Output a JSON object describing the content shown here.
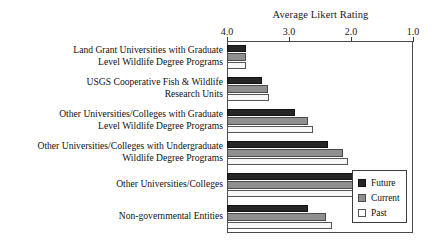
{
  "chart_data": {
    "type": "bar",
    "orientation": "horizontal",
    "title": "Average Likert Rating",
    "xlabel": "",
    "ylabel": "",
    "xlim": [
      4.0,
      1.0
    ],
    "xticks": [
      "4.0",
      "3.0",
      "2.0",
      "1.0"
    ],
    "xtick_values": [
      4.0,
      3.0,
      2.0,
      1.0
    ],
    "axis_reversed": true,
    "grid": false,
    "legend_position": "lower-right",
    "categories": [
      "Land Grant Universities with Graduate\nLevel Wildlife Degree Programs",
      "USGS Cooperative Fish & Wildlife\nResearch Units",
      "Other Universities/Colleges with Graduate\nLevel Wildlife Degree Programs",
      "Other Universities/Colleges with Undergraduate\nWildlife Degree Programs",
      "Other Universities/Colleges",
      "Non-governmental Entities"
    ],
    "series": [
      {
        "name": "Future",
        "color": "#262626",
        "values": [
          1.31,
          1.57,
          2.1,
          2.63,
          3.29,
          2.31
        ]
      },
      {
        "name": "Current",
        "color": "#8f8f8f",
        "values": [
          1.31,
          1.66,
          2.31,
          2.87,
          3.19,
          2.6
        ]
      },
      {
        "name": "Past",
        "color": "#f7f7f7",
        "values": [
          1.31,
          1.68,
          2.39,
          2.95,
          3.37,
          2.69
        ]
      }
    ]
  },
  "legend": {
    "entries": [
      {
        "label": "Future"
      },
      {
        "label": "Current"
      },
      {
        "label": "Past"
      }
    ]
  }
}
